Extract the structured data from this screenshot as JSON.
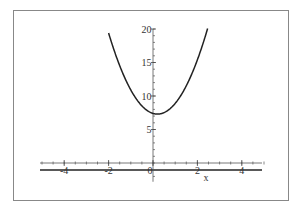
{
  "chart_data": {
    "type": "line",
    "title": "",
    "xlabel": "x",
    "ylabel": "",
    "xlim": [
      -5,
      5
    ],
    "ylim": [
      -2,
      20
    ],
    "x_ticks": [
      -4,
      -2,
      0,
      2,
      4
    ],
    "x_tick_labels": [
      "-4",
      "-2",
      "0",
      "2",
      "4"
    ],
    "y_ticks": [
      5,
      10,
      15,
      20
    ],
    "y_tick_labels": [
      "5",
      "10",
      "15",
      "20"
    ],
    "grid": false,
    "legend": null,
    "series": [
      {
        "name": "f(x)",
        "function": "2.5*(x-0.2)^2 + 7.3",
        "x": [
          -2.0,
          -1.5,
          -1.0,
          -0.5,
          0.0,
          0.2,
          0.5,
          1.0,
          1.5,
          2.0,
          2.5
        ],
        "y": [
          19.4,
          14.5,
          10.9,
          8.5,
          7.4,
          7.3,
          7.5,
          8.9,
          11.5,
          15.4,
          20.5
        ],
        "color": "#222222"
      }
    ],
    "annotations": [
      "horizontal line below x-axis"
    ]
  }
}
